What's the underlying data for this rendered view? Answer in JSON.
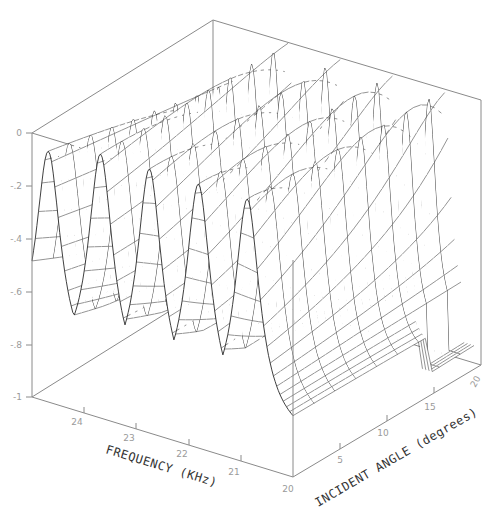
{
  "chart_data": {
    "type": "surface3d",
    "title": "",
    "xlabel": "FREQUENCY (KHz)",
    "ylabel": "INCIDENT ANGLE (degrees)",
    "zlabel": "",
    "x_ticks": [
      "24",
      "23",
      "22",
      "21",
      "20"
    ],
    "y_ticks": [
      "0",
      "5",
      "10",
      "15",
      "20"
    ],
    "z_ticks": [
      "0",
      "-.2",
      "-.4",
      "-.6",
      "-.8",
      "-1"
    ],
    "xlim": [
      24,
      20
    ],
    "ylim": [
      0,
      20
    ],
    "zlim": [
      -1,
      0
    ],
    "grid": false,
    "legend": null,
    "ridges": [
      {
        "index": 1,
        "freq_at_0deg": 23.75,
        "peak_z": -0.05
      },
      {
        "index": 2,
        "freq_at_0deg": 22.95,
        "peak_z": 0.0
      },
      {
        "index": 3,
        "freq_at_0deg": 22.2,
        "peak_z": 0.0
      },
      {
        "index": 4,
        "freq_at_0deg": 21.45,
        "peak_z": 0.0
      },
      {
        "index": 5,
        "freq_at_0deg": 20.7,
        "peak_z": 0.0
      }
    ],
    "valley_z": -0.85
  },
  "axes": {
    "freq_title": "FREQUENCY (KHz)",
    "angle_title": "INCIDENT ANGLE (degrees)",
    "freq_ticks": [
      "24",
      "23",
      "22",
      "21",
      "20"
    ],
    "angle_ticks": [
      "5",
      "10",
      "15",
      "20"
    ],
    "angle_origin_label": "20",
    "z_ticks": [
      "0",
      "-.2",
      "-.4",
      "-.6",
      "-.8",
      "-1"
    ]
  }
}
